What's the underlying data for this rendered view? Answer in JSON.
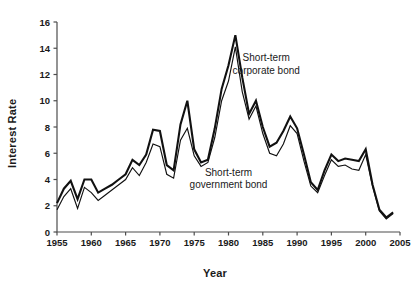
{
  "chart_data": {
    "type": "line",
    "title": "",
    "xlabel": "Year",
    "ylabel": "Interest Rate",
    "xlim": [
      1955,
      2005
    ],
    "ylim": [
      0,
      16
    ],
    "grid": false,
    "legend_position": "inline-annotation",
    "xticks": [
      "1955",
      "1960",
      "1965",
      "1970",
      "1975",
      "1980",
      "1985",
      "1990",
      "1995",
      "2000",
      "2005"
    ],
    "yticks": [
      "0",
      "2",
      "4",
      "6",
      "8",
      "10",
      "12",
      "14",
      "16"
    ],
    "annotations": [
      {
        "name": "corporate-label",
        "line1": "Short-term",
        "line2": "corporate bond",
        "x": 1985.5,
        "y": 13.0
      },
      {
        "name": "government-label",
        "line1": "Short-term",
        "line2": "government bond",
        "x": 1980.0,
        "y": 4.3
      }
    ],
    "x": [
      1955,
      1956,
      1957,
      1958,
      1959,
      1960,
      1961,
      1962,
      1963,
      1964,
      1965,
      1966,
      1967,
      1968,
      1969,
      1970,
      1971,
      1972,
      1973,
      1974,
      1975,
      1976,
      1977,
      1978,
      1979,
      1980,
      1981,
      1982,
      1983,
      1984,
      1985,
      1986,
      1987,
      1988,
      1989,
      1990,
      1991,
      1992,
      1993,
      1994,
      1995,
      1996,
      1997,
      1998,
      1999,
      2000,
      2001,
      2002,
      2003,
      2004
    ],
    "series": [
      {
        "name": "Short-term corporate bond",
        "color": "#111111",
        "linewidth": 2.1,
        "values": [
          2.2,
          3.3,
          3.9,
          2.5,
          4.0,
          4.0,
          3.0,
          3.3,
          3.6,
          4.0,
          4.4,
          5.5,
          5.1,
          5.9,
          7.8,
          7.7,
          5.1,
          4.7,
          8.2,
          10.0,
          6.3,
          5.3,
          5.5,
          7.9,
          10.9,
          12.7,
          15.0,
          11.8,
          9.0,
          10.0,
          8.0,
          6.5,
          6.8,
          7.7,
          8.8,
          7.9,
          5.9,
          3.8,
          3.2,
          4.7,
          5.9,
          5.4,
          5.6,
          5.5,
          5.4,
          6.3,
          3.6,
          1.7,
          1.1,
          1.5
        ],
        "description": "Upper thicker line"
      },
      {
        "name": "Short-term government bond",
        "color": "#111111",
        "linewidth": 1.15,
        "values": [
          1.7,
          2.7,
          3.3,
          1.8,
          3.4,
          3.0,
          2.4,
          2.8,
          3.2,
          3.6,
          4.0,
          4.9,
          4.3,
          5.3,
          6.7,
          6.5,
          4.4,
          4.1,
          7.0,
          7.9,
          5.8,
          5.0,
          5.3,
          7.2,
          10.0,
          11.5,
          14.1,
          10.7,
          8.6,
          9.6,
          7.5,
          6.0,
          5.8,
          6.7,
          8.1,
          7.5,
          5.4,
          3.5,
          3.0,
          4.3,
          5.5,
          5.0,
          5.1,
          4.8,
          4.7,
          5.9,
          3.5,
          1.6,
          1.0,
          1.4
        ],
        "description": "Lower thinner line"
      }
    ]
  },
  "colors": {
    "background": "#ffffff",
    "axis": "#4d4d4d",
    "text": "#1a1a1a",
    "line": "#111111"
  }
}
